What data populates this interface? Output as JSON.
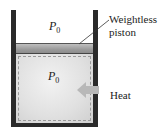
{
  "diagram": {
    "top_pressure": {
      "symbol": "P",
      "subscript": "0"
    },
    "gas_pressure": {
      "symbol": "P",
      "subscript": "0"
    },
    "piston_label_line1": "Weightless",
    "piston_label_line2": "piston",
    "heat_label": "Heat",
    "colors": {
      "wall": "#2a2a2a",
      "piston": "#a0a0a0",
      "gas": "#e4e4e4",
      "arrow": "#b8b8b8"
    }
  }
}
